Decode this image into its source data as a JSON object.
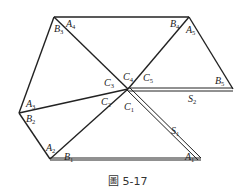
{
  "figure": {
    "caption": "圖 5-17",
    "stroke_color": "#222222",
    "vertices": {
      "top_left": [
        54,
        17
      ],
      "top_right": [
        189,
        17
      ],
      "right": [
        233,
        89
      ],
      "center": [
        128,
        89
      ],
      "left": [
        19,
        113
      ],
      "bottom_left": [
        50,
        159
      ],
      "bottom_right": [
        200,
        159
      ]
    },
    "labels": [
      {
        "id": "A4",
        "base": "A",
        "sub": "4",
        "x": 66,
        "y": 27
      },
      {
        "id": "B3",
        "base": "B",
        "sub": "3",
        "x": 54,
        "y": 32
      },
      {
        "id": "B4",
        "base": "B",
        "sub": "4",
        "x": 170,
        "y": 27
      },
      {
        "id": "A5",
        "base": "A",
        "sub": "5",
        "x": 186,
        "y": 33
      },
      {
        "id": "C3",
        "base": "C",
        "sub": "3",
        "x": 104,
        "y": 86
      },
      {
        "id": "C4",
        "base": "C",
        "sub": "4",
        "x": 123,
        "y": 80
      },
      {
        "id": "C5",
        "base": "C",
        "sub": "5",
        "x": 143,
        "y": 81
      },
      {
        "id": "B5",
        "base": "B",
        "sub": "5",
        "x": 215,
        "y": 84
      },
      {
        "id": "A3",
        "base": "A",
        "sub": "3",
        "x": 26,
        "y": 107
      },
      {
        "id": "B2",
        "base": "B",
        "sub": "2",
        "x": 26,
        "y": 122
      },
      {
        "id": "C2",
        "base": "C",
        "sub": "2",
        "x": 101,
        "y": 105
      },
      {
        "id": "C1",
        "base": "C",
        "sub": "1",
        "x": 124,
        "y": 110
      },
      {
        "id": "S2",
        "base": "S",
        "sub": "2",
        "x": 188,
        "y": 102
      },
      {
        "id": "S1",
        "base": "S",
        "sub": "1",
        "x": 171,
        "y": 134
      },
      {
        "id": "A1",
        "base": "A",
        "sub": "1",
        "x": 185,
        "y": 160
      },
      {
        "id": "A2",
        "base": "A",
        "sub": "2",
        "x": 46,
        "y": 151
      },
      {
        "id": "B1",
        "base": "B",
        "sub": "1",
        "x": 64,
        "y": 160
      }
    ]
  }
}
